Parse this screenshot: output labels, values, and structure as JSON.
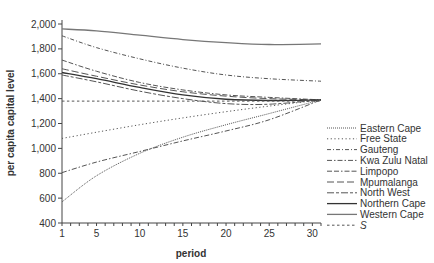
{
  "chart_data": {
    "type": "line",
    "title": "",
    "xlabel": "period",
    "ylabel": "per capita capital level",
    "xlim": [
      1,
      31
    ],
    "ylim": [
      400,
      2000
    ],
    "x_ticks": [
      1,
      5,
      10,
      15,
      20,
      25,
      30
    ],
    "y_ticks": [
      400,
      600,
      800,
      1000,
      1200,
      1400,
      1600,
      1800,
      2000
    ],
    "y_tick_labels": [
      "400",
      "600",
      "800",
      "1,000",
      "1,200",
      "1,400",
      "1,600",
      "1,800",
      "2,000"
    ],
    "grid": false,
    "legend_position": "right",
    "x": [
      1,
      5,
      10,
      15,
      20,
      25,
      31
    ],
    "series": [
      {
        "name": "Eastern Cape",
        "style": "fine-dotted",
        "color": "#555555",
        "values": [
          570,
          780,
          960,
          1090,
          1190,
          1280,
          1390
        ]
      },
      {
        "name": "Free State",
        "style": "dotted",
        "color": "#555555",
        "values": [
          1080,
          1130,
          1190,
          1245,
          1295,
          1340,
          1390
        ]
      },
      {
        "name": "Gauteng",
        "style": "dash-dot-fine",
        "color": "#555555",
        "values": [
          1905,
          1810,
          1720,
          1645,
          1590,
          1560,
          1540
        ]
      },
      {
        "name": "Kwa Zulu Natal",
        "style": "dash-dot",
        "color": "#555555",
        "values": [
          805,
          890,
          975,
          1060,
          1140,
          1230,
          1390
        ]
      },
      {
        "name": "Limpopo",
        "style": "dash-dash-dot",
        "color": "#555555",
        "values": [
          1710,
          1620,
          1530,
          1470,
          1430,
          1410,
          1390
        ]
      },
      {
        "name": "Mpumalanga",
        "style": "long-dash",
        "color": "#555555",
        "values": [
          1640,
          1580,
          1510,
          1455,
          1420,
          1400,
          1390
        ]
      },
      {
        "name": "North West",
        "style": "long-short-dash",
        "color": "#555555",
        "values": [
          1590,
          1535,
          1460,
          1400,
          1360,
          1355,
          1390
        ]
      },
      {
        "name": "Northern Cape",
        "style": "solid",
        "color": "#333333",
        "values": [
          1610,
          1560,
          1490,
          1430,
          1395,
          1385,
          1390
        ]
      },
      {
        "name": "Western Cape",
        "style": "solid-gray",
        "color": "#777777",
        "values": [
          1960,
          1945,
          1910,
          1875,
          1850,
          1835,
          1840
        ]
      },
      {
        "name": "S",
        "style": "short-dash",
        "color": "#555555",
        "values": [
          1380,
          1380,
          1380,
          1380,
          1380,
          1380,
          1380
        ]
      }
    ]
  }
}
